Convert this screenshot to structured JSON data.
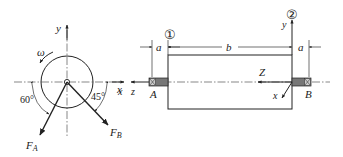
{
  "figure": {
    "left_view": {
      "axis_y_label": "y",
      "axis_x_label": "x",
      "rotation_label": "ω",
      "force_A_label": "F",
      "force_A_sub": "A",
      "force_B_label": "F",
      "force_B_sub": "B",
      "angle_A_label": "60°",
      "angle_B_label": "45°",
      "angle_A_deg": 60,
      "angle_B_deg": 45
    },
    "right_view": {
      "section_1_label": "①",
      "section_2_label": "②",
      "dim_a_left_label": "a",
      "dim_b_label": "b",
      "dim_a_right_label": "a",
      "support_A_label": "A",
      "support_B_label": "B",
      "axis_Z_label": "Z",
      "axis_x_label": "x",
      "axis_y_label": "y",
      "far_left_x_label": "x",
      "far_left_z_label": "z"
    }
  }
}
